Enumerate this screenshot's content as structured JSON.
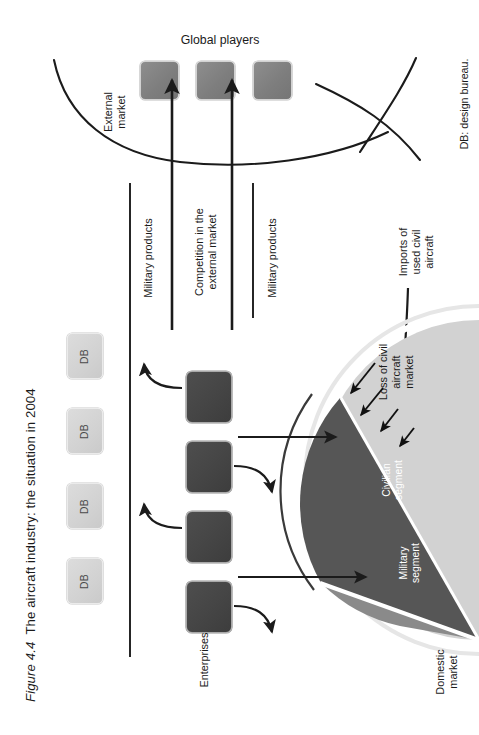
{
  "figure": {
    "caption_label": "Figure 4.4",
    "caption_text": "The aircraft industry: the situation in 2004",
    "footnote": "DB: design bureau."
  },
  "external_market": {
    "title": "Global players",
    "zone_label_line1": "External",
    "zone_label_line2": "market",
    "players": [
      {
        "name": "global-player-1"
      },
      {
        "name": "global-player-2"
      },
      {
        "name": "global-player-3"
      }
    ]
  },
  "flows": {
    "military_products_left": "Military products",
    "competition_line1": "Competition in the",
    "competition_line2": "external market",
    "military_products_right": "Military products",
    "imports_line1": "Imports of",
    "imports_line2": "used civil",
    "imports_line3": "aircraft",
    "loss_line1": "Loss of civil",
    "loss_line2": "aircraft",
    "loss_line3": "market"
  },
  "design_bureaus": {
    "label": "DB",
    "items": [
      "DB",
      "DB",
      "DB",
      "DB"
    ]
  },
  "enterprises": {
    "label": "Enterprises",
    "count": 4
  },
  "domestic_market": {
    "label_line1": "Domestic",
    "label_line2": "market",
    "segments": [
      {
        "name": "civilian",
        "label_line1": "Civilian",
        "label_line2": "segment",
        "color": "#565656"
      },
      {
        "name": "military",
        "label_line1": "Military",
        "label_line2": "segment",
        "color": "#8a8a8a"
      },
      {
        "name": "lost",
        "label_line1": "",
        "label_line2": "",
        "color": "#d2d2d2"
      }
    ]
  },
  "colors": {
    "enterprise_box": "#454545",
    "db_box": "#d4d4d4",
    "global_player_box": "#7e7e7e",
    "civil_segment": "#565656",
    "military_segment": "#8a8a8a",
    "lost_segment": "#d2d2d2",
    "line": "#1b1b1b",
    "background": "#ffffff"
  }
}
